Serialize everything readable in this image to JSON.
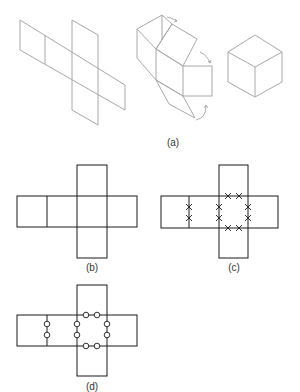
{
  "figure": {
    "panels": [
      {
        "id": "a",
        "label": "(a)",
        "content": "Isometric cross-shaped cube net, partially folded net with fold arrows, assembled cube"
      },
      {
        "id": "b",
        "label": "(b)",
        "content": "Flat cross-shaped cube net of six squares"
      },
      {
        "id": "c",
        "label": "(c)",
        "content": "Same net with pairs of X marks on edges that meet when folded"
      },
      {
        "id": "d",
        "label": "(d)",
        "content": "Same net with pairs of circle marks on edges that meet when folded"
      }
    ]
  },
  "colors": {
    "panel_a_stroke": "#a8a8a8",
    "net_stroke": "#1a1a1a",
    "label": "#333333"
  }
}
